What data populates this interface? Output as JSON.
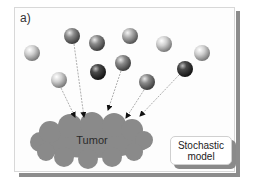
{
  "panel": {
    "label": "a)"
  },
  "tumor": {
    "label": "Tumor",
    "color": "#8a8a8a"
  },
  "model_box": {
    "line1": "Stochastic",
    "line2": "model"
  },
  "cells": [
    {
      "id": 1,
      "cx": 32,
      "cy": 53,
      "shade": "light"
    },
    {
      "id": 2,
      "cx": 72,
      "cy": 36,
      "shade": "medium"
    },
    {
      "id": 3,
      "cx": 97,
      "cy": 43,
      "shade": "medium"
    },
    {
      "id": 4,
      "cx": 130,
      "cy": 36,
      "shade": "medium-light"
    },
    {
      "id": 5,
      "cx": 164,
      "cy": 44,
      "shade": "light"
    },
    {
      "id": 6,
      "cx": 202,
      "cy": 53,
      "shade": "light"
    },
    {
      "id": 7,
      "cx": 59,
      "cy": 80,
      "shade": "light"
    },
    {
      "id": 8,
      "cx": 98,
      "cy": 72,
      "shade": "dark"
    },
    {
      "id": 9,
      "cx": 123,
      "cy": 63,
      "shade": "medium"
    },
    {
      "id": 10,
      "cx": 147,
      "cy": 82,
      "shade": "medium"
    },
    {
      "id": 11,
      "cx": 185,
      "cy": 69,
      "shade": "dark"
    }
  ],
  "arrows": [
    {
      "from_cell": 7,
      "to": [
        75,
        118
      ]
    },
    {
      "from_cell": 2,
      "to": [
        84,
        118
      ]
    },
    {
      "from_cell": 9,
      "to": [
        108,
        111
      ]
    },
    {
      "from_cell": 10,
      "to": [
        126,
        119
      ]
    },
    {
      "from_cell": 11,
      "to": [
        140,
        117
      ]
    }
  ]
}
